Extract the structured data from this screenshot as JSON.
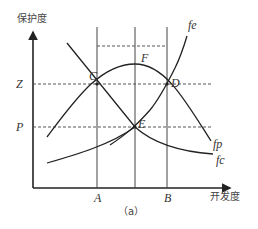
{
  "diagram": {
    "caption": "（a）",
    "y_axis_label": "保护度",
    "x_axis_label": "开发度",
    "y_ticks": {
      "z": "Z",
      "p": "P"
    },
    "x_ticks": {
      "a": "A",
      "b": "B"
    },
    "points": {
      "c": "C",
      "d": "D",
      "e": "E",
      "f": "F"
    },
    "curves": {
      "fe": "fe",
      "fp": "fp",
      "fc": "fc"
    },
    "colors": {
      "line": "#2a2a2a",
      "dash": "#555555",
      "text": "#333333"
    }
  }
}
